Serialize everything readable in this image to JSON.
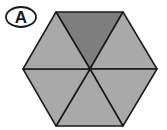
{
  "figure": {
    "label": "A",
    "shape": "regular hexagon divided into 6 triangles",
    "total_parts": 6,
    "shaded_parts": 1,
    "colors": {
      "light_fill": "#a9a9a9",
      "dark_fill": "#7e7e7e",
      "stroke": "#1a1a1a",
      "background": "#ffffff"
    }
  }
}
